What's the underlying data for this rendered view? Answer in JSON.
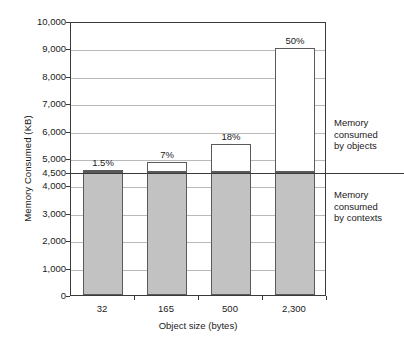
{
  "chart_data": {
    "type": "bar",
    "title": "",
    "xlabel": "Object size (bytes)",
    "ylabel": "Memory Consumed (KB)",
    "categories": [
      "32",
      "165",
      "500",
      "2,300"
    ],
    "ylim": [
      0,
      10000
    ],
    "yticks": [
      "0",
      "1,000",
      "2,000",
      "3,000",
      "4,000",
      "4,500",
      "5,000",
      "6,000",
      "7,000",
      "8,000",
      "9,000",
      "10,000"
    ],
    "ytick_values": [
      0,
      1000,
      2000,
      3000,
      4000,
      4500,
      5000,
      6000,
      7000,
      8000,
      9000,
      10000
    ],
    "grid": true,
    "legend_position": "right",
    "baseline_value": 4500,
    "series": [
      {
        "name": "Memory consumed by contexts",
        "color": "#c2c2c2",
        "values": [
          4500,
          4500,
          4500,
          4500
        ]
      },
      {
        "name": "Memory consumed by objects",
        "color": "#ffffff",
        "values": [
          70,
          340,
          1000,
          4500
        ]
      }
    ],
    "totals": [
      4570,
      4840,
      5500,
      9000
    ],
    "annotations": [
      "1.5%",
      "7%",
      "18%",
      "50%"
    ]
  },
  "legend": {
    "objects_line1": "Memory",
    "objects_line2": "consumed",
    "objects_line3": "by objects",
    "contexts_line1": "Memory",
    "contexts_line2": "consumed",
    "contexts_line3": "by contexts"
  }
}
